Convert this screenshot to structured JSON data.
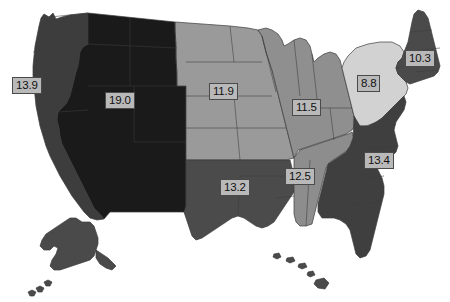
{
  "map": {
    "title": "United States choropleth map by census division",
    "projection_note": "Alaska and Hawaii shown as insets at lower left and lower center",
    "background_color": "#ffffff",
    "border_color": "#3c3c3c",
    "label_style": {
      "fill": "#b9b9b9",
      "border": "#4a4a4a",
      "text_color": "#111111"
    }
  },
  "chart_data": {
    "type": "choropleth",
    "value_format": "one decimal",
    "vmin": 8.8,
    "vmax": 19.0,
    "legend": "none",
    "regions": [
      {
        "name": "Pacific",
        "value": "13.9",
        "color": "#3d3d3d",
        "label_x": 12,
        "label_y": 77
      },
      {
        "name": "Mountain",
        "value": "19.0",
        "color": "#1a1a1a",
        "label_x": 105,
        "label_y": 92
      },
      {
        "name": "West North Central",
        "value": "11.9",
        "color": "#9a9a9a",
        "label_x": 209,
        "label_y": 83
      },
      {
        "name": "East North Central",
        "value": "11.5",
        "color": "#8f8f8f",
        "label_x": 292,
        "label_y": 99
      },
      {
        "name": "Middle Atlantic",
        "value": "8.8",
        "color": "#d2d2d2",
        "label_x": 357,
        "label_y": 75
      },
      {
        "name": "New England",
        "value": "10.3",
        "color": "#4a4a4a",
        "label_x": 405,
        "label_y": 50
      },
      {
        "name": "West South Central",
        "value": "13.2",
        "color": "#4b4b4b",
        "label_x": 220,
        "label_y": 179
      },
      {
        "name": "East South Central",
        "value": "12.5",
        "color": "#8d8d8d",
        "label_x": 285,
        "label_y": 168
      },
      {
        "name": "South Atlantic",
        "value": "13.4",
        "color": "#3f3f3f",
        "label_x": 364,
        "label_y": 152
      }
    ],
    "insets": [
      {
        "name": "Alaska",
        "color": "#4a4a4a"
      },
      {
        "name": "Hawaii",
        "color": "#4a4a4a"
      }
    ]
  }
}
